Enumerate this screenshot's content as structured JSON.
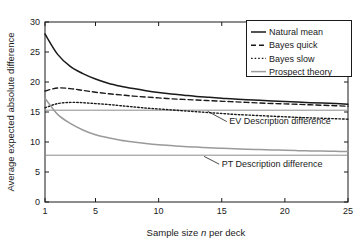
{
  "chart_data": {
    "type": "line",
    "title": "",
    "xlabel_parts": {
      "prefix": "Sample size ",
      "italic": "n",
      "suffix": " per deck"
    },
    "xlabel": "Sample size n per deck",
    "ylabel": "Average expected absolute difference",
    "xlim": [
      1,
      25
    ],
    "ylim": [
      0,
      30
    ],
    "xticks": [
      1,
      5,
      10,
      15,
      20,
      25
    ],
    "xtick_labels": [
      "1",
      "5",
      "10",
      "15",
      "20",
      "25"
    ],
    "yticks": [
      0,
      5,
      10,
      15,
      20,
      25,
      30
    ],
    "ytick_labels": [
      "0",
      "5",
      "10",
      "15",
      "20",
      "25",
      "30"
    ],
    "grid": false,
    "legend_position": "top-right",
    "x": [
      1,
      2,
      3,
      4,
      5,
      6,
      7,
      8,
      9,
      10,
      11,
      12,
      13,
      14,
      15,
      16,
      17,
      18,
      19,
      20,
      21,
      22,
      23,
      24,
      25
    ],
    "series": [
      {
        "name": "Natural mean",
        "style": "solid",
        "color": "#1a1a1a",
        "values": [
          28.0,
          24.6,
          22.6,
          21.4,
          20.5,
          19.8,
          19.3,
          18.9,
          18.55,
          18.25,
          18.0,
          17.8,
          17.6,
          17.45,
          17.3,
          17.15,
          17.05,
          16.95,
          16.85,
          16.75,
          16.65,
          16.55,
          16.48,
          16.4,
          16.3
        ]
      },
      {
        "name": "Bayes quick",
        "style": "dashed",
        "color": "#1a1a1a",
        "values": [
          18.5,
          19.0,
          18.9,
          18.6,
          18.3,
          18.05,
          17.85,
          17.65,
          17.5,
          17.35,
          17.2,
          17.1,
          17.0,
          16.9,
          16.8,
          16.7,
          16.6,
          16.5,
          16.42,
          16.35,
          16.28,
          16.2,
          16.12,
          16.05,
          15.95
        ]
      },
      {
        "name": "Bayes slow",
        "style": "dotted",
        "color": "#1a1a1a",
        "values": [
          15.7,
          16.4,
          16.6,
          16.55,
          16.4,
          16.25,
          16.05,
          15.85,
          15.65,
          15.5,
          15.35,
          15.2,
          15.05,
          14.9,
          14.75,
          14.6,
          14.5,
          14.4,
          14.3,
          14.2,
          14.1,
          14.02,
          13.95,
          13.88,
          13.8
        ]
      },
      {
        "name": "Prospect theory",
        "style": "solid",
        "color": "#9a9a9a",
        "values": [
          17.3,
          14.6,
          13.1,
          12.0,
          11.2,
          10.7,
          10.3,
          10.0,
          9.75,
          9.55,
          9.4,
          9.25,
          9.15,
          9.05,
          8.95,
          8.88,
          8.8,
          8.74,
          8.68,
          8.62,
          8.56,
          8.52,
          8.48,
          8.44,
          8.4
        ]
      }
    ],
    "reference_lines": [
      {
        "name": "EV Description difference",
        "value": 15.3,
        "color": "#8c8c8c",
        "annotation": "EV Description difference"
      },
      {
        "name": "PT Description difference",
        "value": 7.8,
        "color": "#8c8c8c",
        "annotation": "PT Description difference"
      }
    ],
    "annotations": [
      {
        "text": "EV Description difference",
        "x": 15.6,
        "y": 13.0
      },
      {
        "text": "PT Description difference",
        "x": 15.0,
        "y": 5.9
      }
    ]
  },
  "legend": {
    "entries": [
      {
        "label": "Natural mean"
      },
      {
        "label": "Bayes quick"
      },
      {
        "label": "Bayes slow"
      },
      {
        "label": "Prospect theory"
      }
    ]
  }
}
